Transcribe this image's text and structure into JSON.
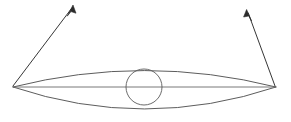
{
  "figure": {
    "title": "Lens-shaped ellipse diagram with central circle and two divergent arrows",
    "width": 291,
    "height": 122,
    "background_color": "#ffffff",
    "stroke_color": "#4a4a4a",
    "arrow_color": "#2b2b2b",
    "stroke_width": 0.9
  },
  "shapes": {
    "left_tip": {
      "x": 13,
      "y": 87,
      "label": "left-vertex"
    },
    "right_tip": {
      "x": 276,
      "y": 87,
      "label": "right-vertex"
    },
    "upper_arc": {
      "name": "upper-arc",
      "path": "M 13 87 Q 144.5 54 276 87",
      "apex_y": 62
    },
    "lower_arc": {
      "name": "lower-arc",
      "path": "M 13 87 Q 144.5 131 276 87",
      "base_y": 110
    },
    "axis_line": {
      "name": "horizontal-axis",
      "x1": 13,
      "y1": 87,
      "x2": 276,
      "y2": 87
    },
    "center_circle": {
      "name": "center-circle",
      "cx": 144,
      "cy": 87,
      "r": 18
    }
  },
  "arrows": {
    "left": {
      "name": "left-arrow",
      "from": {
        "x": 13,
        "y": 86
      },
      "to": {
        "x": 73,
        "y": 6
      },
      "head_length": 11,
      "head_width": 4.4
    },
    "right": {
      "name": "right-arrow",
      "from": {
        "x": 275,
        "y": 86
      },
      "to": {
        "x": 247,
        "y": 10
      },
      "head_length": 11,
      "head_width": 4.4
    }
  }
}
